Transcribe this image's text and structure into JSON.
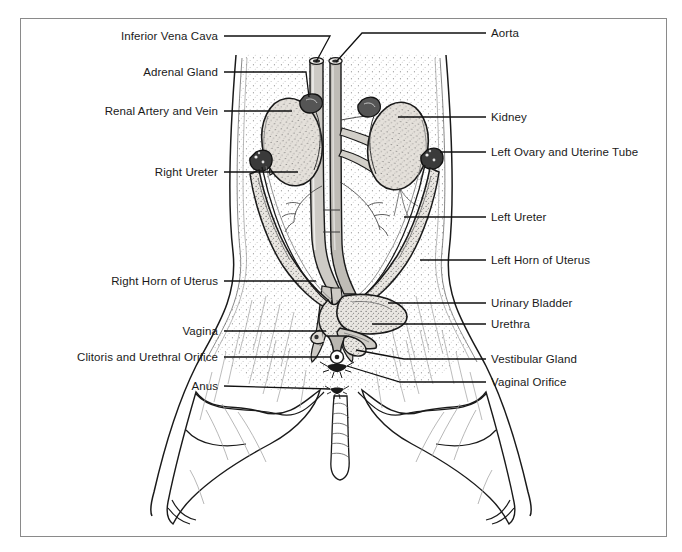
{
  "figure": {
    "background_color": "#ffffff",
    "border_color": "#8a8a8a",
    "ink_color": "#111111",
    "tissue_fill": "#dcd8d2",
    "organ_fill": "#e8e5e0"
  },
  "labels_left": [
    {
      "id": "inferior-vena-cava",
      "text": "Inferior Vena Cava",
      "x": 218,
      "y": 36
    },
    {
      "id": "adrenal-gland",
      "text": "Adrenal Gland",
      "x": 218,
      "y": 72
    },
    {
      "id": "renal-artery-and-vein",
      "text": "Renal Artery and Vein",
      "x": 218,
      "y": 111
    },
    {
      "id": "right-ureter",
      "text": "Right Ureter",
      "x": 218,
      "y": 172
    },
    {
      "id": "right-horn-of-uterus",
      "text": "Right Horn of Uterus",
      "x": 218,
      "y": 281
    },
    {
      "id": "vagina",
      "text": "Vagina",
      "x": 218,
      "y": 331
    },
    {
      "id": "clitoris-and-urethral-orifice",
      "text": "Clitoris and Urethral Orifice",
      "x": 218,
      "y": 357
    },
    {
      "id": "anus",
      "text": "Anus",
      "x": 218,
      "y": 386
    }
  ],
  "labels_right": [
    {
      "id": "aorta",
      "text": "Aorta",
      "x": 491,
      "y": 33
    },
    {
      "id": "kidney",
      "text": "Kidney",
      "x": 491,
      "y": 117
    },
    {
      "id": "left-ovary-and-uterine-tube",
      "text": "Left Ovary and Uterine Tube",
      "x": 491,
      "y": 152
    },
    {
      "id": "left-ureter",
      "text": "Left Ureter",
      "x": 491,
      "y": 217
    },
    {
      "id": "left-horn-of-uterus",
      "text": "Left Horn of Uterus",
      "x": 491,
      "y": 260
    },
    {
      "id": "urinary-bladder",
      "text": "Urinary Bladder",
      "x": 491,
      "y": 303
    },
    {
      "id": "urethra",
      "text": "Urethra",
      "x": 491,
      "y": 324
    },
    {
      "id": "vestibular-gland",
      "text": "Vestibular Gland",
      "x": 491,
      "y": 359
    },
    {
      "id": "vaginal-orifice",
      "text": "Vaginal Orifice",
      "x": 491,
      "y": 382
    }
  ]
}
